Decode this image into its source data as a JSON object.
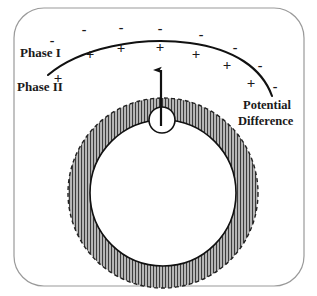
{
  "figure": {
    "type": "electrochemical-interface-diagram",
    "width": 317,
    "height": 296,
    "background_color": "#ffffff",
    "frame": {
      "name": "rounded-rectangle-frame",
      "stroke_color": "#9a9a9a",
      "fill_color": "#ffffff",
      "x": 14,
      "y": 8,
      "width": 290,
      "height": 278,
      "corner_radius": 30,
      "stroke_width": 1.2
    }
  },
  "labels": {
    "phase_one": "Phase I",
    "phase_two": "Phase II",
    "potential_line1": "Potential",
    "potential_line2": "Difference"
  },
  "label_positions": {
    "phase_one": {
      "x": 20,
      "y": 57,
      "font_size": 13
    },
    "phase_two": {
      "x": 17,
      "y": 91,
      "font_size": 13
    },
    "potential_line1": {
      "x": 243,
      "y": 109,
      "font_size": 12.5
    },
    "potential_line2": {
      "x": 238,
      "y": 125,
      "font_size": 12.5
    }
  },
  "interface_curve": {
    "name": "phase-boundary-curve",
    "stroke_color": "#111111",
    "stroke_width": 2.1,
    "path": "M 48,75 C 80,48 140,36 190,43 C 234,49 262,68 272,96"
  },
  "charges": {
    "negative_symbol": "-",
    "positive_symbol": "+",
    "negative_font_size": 14,
    "positive_font_size": 15,
    "negative": [
      {
        "x": 52,
        "y": 45
      },
      {
        "x": 84,
        "y": 34
      },
      {
        "x": 121,
        "y": 32
      },
      {
        "x": 160,
        "y": 33
      },
      {
        "x": 201,
        "y": 39
      },
      {
        "x": 235,
        "y": 52
      },
      {
        "x": 260,
        "y": 70
      },
      {
        "x": 275,
        "y": 91
      }
    ],
    "positive": [
      {
        "x": 58,
        "y": 83
      },
      {
        "x": 90,
        "y": 59
      },
      {
        "x": 121,
        "y": 53
      },
      {
        "x": 160,
        "y": 52
      },
      {
        "x": 196,
        "y": 59
      },
      {
        "x": 227,
        "y": 70
      },
      {
        "x": 251,
        "y": 88
      }
    ]
  },
  "annulus": {
    "name": "hatched-annulus",
    "center_x": 163,
    "center_y": 193,
    "outer_radius": 95,
    "inner_radius": 73,
    "fill_color": "#b3b3b3",
    "hatch_color": "#3c3c3c",
    "hatch_spacing": 3,
    "hatch_width": 1.1,
    "outer_stroke_color": "#222222",
    "outer_stroke_dash": "4 3",
    "inner_stroke_color": "#111111",
    "inner_stroke_width": 1.6
  },
  "small_circle": {
    "name": "particle-circle",
    "center_x": 162,
    "center_y": 120,
    "radius": 13,
    "fill_color": "#ffffff",
    "stroke_color": "#111111",
    "stroke_width": 1.6
  },
  "arrow": {
    "name": "potential-difference-arrow",
    "x": 161,
    "y_tail": 126,
    "y_head": 68,
    "stroke_color": "#111111",
    "stroke_width": 2.2,
    "head_width": 6,
    "head_length": 9
  }
}
